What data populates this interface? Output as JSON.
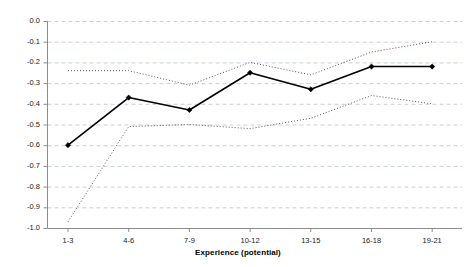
{
  "chart_data": {
    "type": "line",
    "title": "",
    "xlabel": "Experience (potential)",
    "ylabel": "",
    "categories": [
      "1-3",
      "4-6",
      "7-9",
      "10-12",
      "13-15",
      "16-18",
      "19-21"
    ],
    "ylim": [
      -1.0,
      0.0
    ],
    "ytick_labels": [
      "0.0",
      "-0.1",
      "-0.2",
      "-0.3",
      "-0.4",
      "-0.5",
      "-0.6",
      "-0.7",
      "-0.8",
      "-0.9",
      "-1.0"
    ],
    "ytick_values": [
      0.0,
      -0.1,
      -0.2,
      -0.3,
      -0.4,
      -0.5,
      -0.6,
      -0.7,
      -0.8,
      -0.9,
      -1.0
    ],
    "grid": true,
    "legend_position": "none",
    "series": [
      {
        "name": "estimate",
        "style": "solid",
        "marker": "filled-diamond",
        "color": "#000000",
        "values": [
          -0.6,
          -0.37,
          -0.43,
          -0.25,
          -0.33,
          -0.22,
          -0.22
        ]
      },
      {
        "name": "upper confidence bound",
        "style": "dotted",
        "marker": "none",
        "color": "#555555",
        "values": [
          -0.24,
          -0.24,
          -0.31,
          -0.2,
          -0.26,
          -0.15,
          -0.1
        ]
      },
      {
        "name": "lower confidence bound",
        "style": "dotted",
        "marker": "none",
        "color": "#555555",
        "values": [
          -0.97,
          -0.51,
          -0.5,
          -0.52,
          -0.47,
          -0.36,
          -0.4
        ]
      }
    ]
  },
  "axis": {
    "x_title": "Experience (potential)"
  },
  "colors": {
    "grid": "#b9c4d6",
    "axis": "#808080",
    "series": "#000000",
    "band": "#555555",
    "background": "#ffffff"
  }
}
